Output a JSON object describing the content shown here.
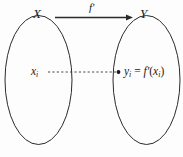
{
  "figure": {
    "kind": "function-mapping-diagram",
    "background_color": "#fdfdfd",
    "stroke_color": "#2b2b2b",
    "text_color": "#1a1a1a"
  },
  "sets": {
    "domain": {
      "label": "X",
      "element_base": "x",
      "element_subscript": "i"
    },
    "codomain": {
      "label": "Y",
      "element_base": "y",
      "element_subscript": "i"
    }
  },
  "mapping": {
    "function_base": "f",
    "prime": "′",
    "arrow_label_base": "f",
    "equals": "=",
    "open_paren": "(",
    "close_paren": ")"
  },
  "annotations": {
    "arrow_solid": "solid arrow from set X to set Y",
    "line_dashed": "dashed correspondence line from x_i to y_i",
    "dot_marker": "filled dot at image point"
  }
}
